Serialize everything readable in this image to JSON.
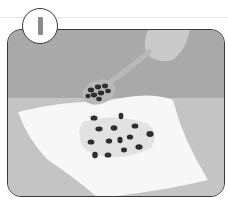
{
  "illustration": {
    "step_number": "1",
    "scene": "Hand pouring seeds from a spoon onto a damp paper towel",
    "colors": {
      "wall": "#a9a9a9",
      "table": "#c4c4c4",
      "towel": "#f7f7f7",
      "damp_area": "#e2e2e2",
      "seed": "#2e2e2e",
      "spoon": "#b8b8b8",
      "hand": "#c9c9c9",
      "outline": "#3a3a3a"
    },
    "seeds_on_towel": 15,
    "seeds_in_spoon": 8
  }
}
